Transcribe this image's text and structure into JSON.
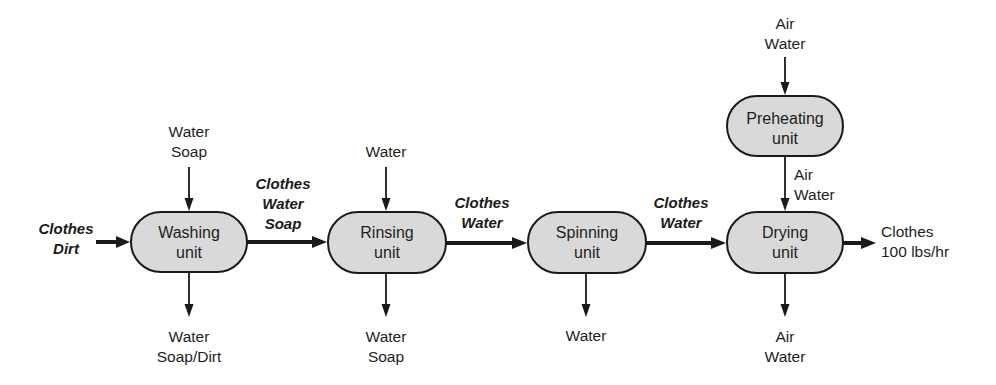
{
  "diagram": {
    "colors": {
      "unit_fill": "#d9d9d9",
      "stroke": "#1a1a1a",
      "text": "#1e1e1e"
    },
    "inputs": {
      "main_feed": [
        "Clothes",
        "Dirt"
      ]
    },
    "units": {
      "washing": {
        "line1": "Washing",
        "line2": "unit",
        "in_top": [
          "Water",
          "Soap"
        ],
        "out_bottom": [
          "Water",
          "Soap/Dirt"
        ]
      },
      "rinsing": {
        "line1": "Rinsing",
        "line2": "unit",
        "in_top": [
          "Water"
        ],
        "out_bottom": [
          "Water",
          "Soap"
        ]
      },
      "spinning": {
        "line1": "Spinning",
        "line2": "unit",
        "out_bottom": [
          "Water"
        ]
      },
      "preheating": {
        "line1": "Preheating",
        "line2": "unit",
        "in_top": [
          "Air",
          "Water"
        ],
        "out_bottom": [
          "Air",
          "Water"
        ]
      },
      "drying": {
        "line1": "Drying",
        "line2": "unit",
        "out_bottom": [
          "Air",
          "Water"
        ]
      }
    },
    "streams": {
      "washing_to_rinsing": [
        "Clothes",
        "Water",
        "Soap"
      ],
      "rinsing_to_spinning": [
        "Clothes",
        "Water"
      ],
      "spinning_to_drying": [
        "Clothes",
        "Water"
      ]
    },
    "outputs": {
      "final_product": [
        "Clothes",
        "100 lbs/hr"
      ]
    }
  }
}
